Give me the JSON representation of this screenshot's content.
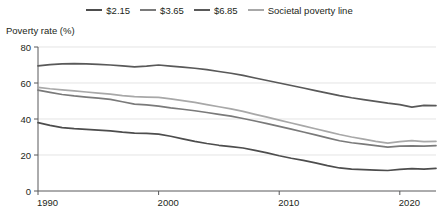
{
  "chart_data": {
    "type": "line",
    "title": "",
    "subtitle": "",
    "xlabel": "",
    "ylabel": "Poverty rate (%)",
    "ylim": [
      0,
      80
    ],
    "xlim": [
      1990,
      2023
    ],
    "yticks": [
      0,
      20,
      40,
      60,
      80
    ],
    "xticks": [
      1990,
      2000,
      2010,
      2020
    ],
    "grid": true,
    "legend_position": "top",
    "x": [
      1990,
      1991,
      1992,
      1993,
      1994,
      1995,
      1996,
      1997,
      1998,
      1999,
      2000,
      2001,
      2002,
      2003,
      2004,
      2005,
      2006,
      2007,
      2008,
      2009,
      2010,
      2011,
      2012,
      2013,
      2014,
      2015,
      2016,
      2017,
      2018,
      2019,
      2020,
      2021,
      2022,
      2023
    ],
    "series": [
      {
        "name": "$2.15",
        "color": "#4d4d4d",
        "values": [
          38,
          36.5,
          35.2,
          34.6,
          34.2,
          33.8,
          33.4,
          32.7,
          32.2,
          32.0,
          31.6,
          30.4,
          29.0,
          27.6,
          26.4,
          25.4,
          24.7,
          23.9,
          22.6,
          21.2,
          19.6,
          18.2,
          17.0,
          15.6,
          14.1,
          12.8,
          12.2,
          11.9,
          11.6,
          11.4,
          12.0,
          12.4,
          12.2,
          12.6
        ]
      },
      {
        "name": "$3.65",
        "color": "#7a7a7a",
        "values": [
          56.0,
          54.8,
          53.6,
          52.8,
          52.2,
          51.6,
          50.9,
          49.6,
          48.3,
          47.8,
          47.2,
          46.2,
          45.4,
          44.6,
          43.6,
          42.6,
          41.6,
          40.3,
          38.9,
          37.4,
          35.9,
          34.4,
          32.8,
          31.2,
          29.5,
          27.9,
          26.8,
          26.0,
          25.2,
          24.4,
          24.9,
          25.1,
          24.9,
          25.2
        ]
      },
      {
        "name": "$6.85",
        "color": "#595959",
        "values": [
          69.5,
          70.2,
          70.6,
          70.8,
          70.6,
          70.3,
          70.0,
          69.5,
          69.0,
          69.4,
          70.0,
          69.4,
          68.8,
          68.2,
          67.4,
          66.4,
          65.4,
          64.2,
          62.8,
          61.4,
          60.0,
          58.6,
          57.2,
          55.8,
          54.4,
          53.0,
          51.8,
          50.8,
          49.8,
          48.8,
          48.0,
          46.6,
          47.6,
          47.4
        ]
      },
      {
        "name": "Societal poverty line",
        "color": "#a8a8a8",
        "values": [
          57.6,
          56.8,
          56.2,
          55.6,
          55.0,
          54.4,
          53.8,
          53.0,
          52.4,
          52.2,
          52.0,
          51.2,
          50.2,
          49.2,
          48.0,
          46.8,
          45.6,
          44.2,
          42.6,
          41.0,
          39.4,
          37.8,
          36.2,
          34.6,
          33.0,
          31.4,
          30.0,
          28.8,
          27.6,
          26.6,
          27.4,
          28.0,
          27.4,
          27.6
        ]
      }
    ]
  },
  "legend": {
    "items": [
      {
        "label": "$2.15"
      },
      {
        "label": "$3.65"
      },
      {
        "label": "$6.85"
      },
      {
        "label": "Societal poverty line"
      }
    ]
  },
  "axes": {
    "y_title": "Poverty rate (%)",
    "y_tick_labels": [
      "0",
      "20",
      "40",
      "60",
      "80"
    ],
    "x_tick_labels": [
      "1990",
      "2000",
      "2010",
      "2020"
    ]
  }
}
